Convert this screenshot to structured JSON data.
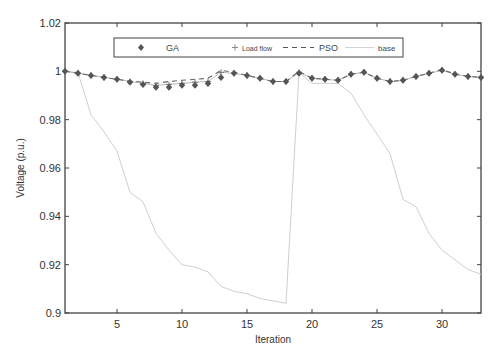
{
  "chart_data": {
    "type": "line",
    "title": "",
    "xlabel": "Iteration",
    "ylabel": "Voltage (p.u.)",
    "xlim": [
      1,
      33
    ],
    "ylim": [
      0.9,
      1.02
    ],
    "xticks": [
      5,
      10,
      15,
      20,
      25,
      30
    ],
    "yticks": [
      0.9,
      0.92,
      0.94,
      0.96,
      0.98,
      1,
      1.02
    ],
    "ytick_labels": [
      "0.9",
      "0.92",
      "0.94",
      "0.96",
      "0.98",
      "1",
      "1.02"
    ],
    "grid": false,
    "legend_position": "top-inside",
    "x": [
      1,
      2,
      3,
      4,
      5,
      6,
      7,
      8,
      9,
      10,
      11,
      12,
      13,
      14,
      15,
      16,
      17,
      18,
      19,
      20,
      21,
      22,
      23,
      24,
      25,
      26,
      27,
      28,
      29,
      30,
      31,
      32,
      33
    ],
    "series": [
      {
        "name": "GA",
        "style": "diamond-markers",
        "values": [
          1.0,
          0.9992,
          0.9983,
          0.9975,
          0.9967,
          0.9955,
          0.9946,
          0.9934,
          0.9934,
          0.9942,
          0.9942,
          0.995,
          0.9975,
          0.9992,
          0.9983,
          0.9971,
          0.9958,
          0.9958,
          0.9992,
          0.9971,
          0.9967,
          0.9963,
          0.9988,
          0.9996,
          0.9971,
          0.9958,
          0.9963,
          0.9979,
          0.9992,
          1.0004,
          0.9988,
          0.9979,
          0.9975
        ]
      },
      {
        "name": "Load flow",
        "style": "plus-markers",
        "values": [
          1.0,
          0.9992,
          0.9983,
          0.9975,
          0.9967,
          0.9958,
          0.995,
          0.9942,
          0.9946,
          0.995,
          0.9955,
          0.9958,
          0.9996,
          0.9992,
          0.9983,
          0.9971,
          0.9958,
          0.9958,
          0.9996,
          0.9971,
          0.9967,
          0.9963,
          0.9988,
          0.9996,
          0.9971,
          0.9958,
          0.9963,
          0.9979,
          0.9992,
          1.0004,
          0.9988,
          0.9979,
          0.9975
        ]
      },
      {
        "name": "PSO",
        "style": "dashed",
        "values": [
          1.0,
          0.9992,
          0.9983,
          0.9975,
          0.9967,
          0.996,
          0.9955,
          0.995,
          0.9958,
          0.9963,
          0.9967,
          0.9971,
          1.0004,
          0.9996,
          0.9983,
          0.9971,
          0.9958,
          0.9958,
          1.0,
          0.9971,
          0.9967,
          0.9963,
          0.9988,
          0.9996,
          0.9971,
          0.9958,
          0.9963,
          0.9979,
          0.9992,
          1.0008,
          0.9988,
          0.9979,
          0.9975
        ]
      },
      {
        "name": "base",
        "style": "thin-solid",
        "values": [
          1.0,
          0.9995,
          0.982,
          0.975,
          0.967,
          0.95,
          0.946,
          0.933,
          0.926,
          0.92,
          0.919,
          0.917,
          0.911,
          0.909,
          0.908,
          0.906,
          0.905,
          0.904,
          0.9995,
          0.995,
          0.995,
          0.995,
          0.991,
          0.982,
          0.974,
          0.966,
          0.947,
          0.944,
          0.933,
          0.926,
          0.922,
          0.918,
          0.916
        ]
      }
    ]
  },
  "legend": {
    "items": [
      {
        "label": "GA"
      },
      {
        "label": "Load flow"
      },
      {
        "label": "PSO"
      },
      {
        "label": "base"
      }
    ]
  },
  "axes": {
    "xlabel": "Iteration",
    "ylabel": "Voltage (p.u.)",
    "xtick_labels": [
      "5",
      "10",
      "15",
      "20",
      "25",
      "30"
    ],
    "ytick_labels": [
      "0.9",
      "0.92",
      "0.94",
      "0.96",
      "0.98",
      "1",
      "1.02"
    ]
  },
  "colors": {
    "axis": "#444444",
    "ga": "#555555",
    "loadflow": "#777777",
    "pso": "#666666",
    "base": "#cfcfcf"
  }
}
